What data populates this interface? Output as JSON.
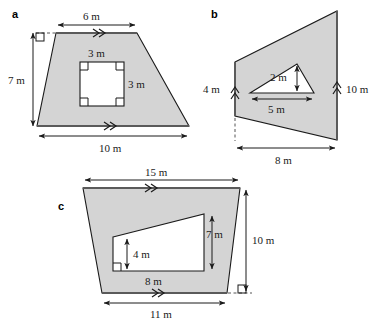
{
  "page": {
    "background_color": "#ffffff",
    "shape_fill_color": "#d4d4d4",
    "outline_color": "#1a1a1a",
    "hole_fill_color": "#ffffff"
  },
  "figures": [
    {
      "label": "a",
      "description": "Trapezium with a square hole cut out",
      "outer_shape": "trapezium",
      "inner_shape": "square",
      "right_angle_markers": 5,
      "parallel_marks": "double-chevron",
      "dimensions": [
        {
          "name": "top",
          "value": "6 m"
        },
        {
          "name": "height",
          "value": "7 m"
        },
        {
          "name": "bottom",
          "value": "10 m"
        },
        {
          "name": "hole-top",
          "value": "3 m"
        },
        {
          "name": "hole-side",
          "value": "3 m"
        }
      ]
    },
    {
      "label": "b",
      "description": "Trapezium on its side with a triangular hole cut out",
      "outer_shape": "trapezium",
      "inner_shape": "triangle",
      "parallel_marks": "double-chevron",
      "dimensions": [
        {
          "name": "left-side",
          "value": "4 m"
        },
        {
          "name": "right-side",
          "value": "10 m"
        },
        {
          "name": "base",
          "value": "8 m"
        },
        {
          "name": "triangle-height",
          "value": "2 m"
        },
        {
          "name": "triangle-base",
          "value": "5 m"
        }
      ]
    },
    {
      "label": "c",
      "description": "Trapezium with a trapezium hole cut out",
      "outer_shape": "trapezium",
      "inner_shape": "trapezium",
      "right_angle_markers": 2,
      "parallel_marks": "double-chevron",
      "dimensions": [
        {
          "name": "top",
          "value": "15 m"
        },
        {
          "name": "height",
          "value": "10 m"
        },
        {
          "name": "bottom",
          "value": "11 m"
        },
        {
          "name": "hole-left-height",
          "value": "4 m"
        },
        {
          "name": "hole-right-height",
          "value": "7 m"
        },
        {
          "name": "hole-base",
          "value": "8 m"
        }
      ]
    }
  ],
  "labels": {
    "fig_a": "a",
    "fig_b": "b",
    "fig_c": "c",
    "a_top": "6 m",
    "a_height": "7 m",
    "a_bottom": "10 m",
    "a_hole_top": "3 m",
    "a_hole_side": "3 m",
    "b_left": "4 m",
    "b_right": "10 m",
    "b_base": "8 m",
    "b_tri_height": "2 m",
    "b_tri_base": "5 m",
    "c_top": "15 m",
    "c_height": "10 m",
    "c_bottom": "11 m",
    "c_hole_left": "4 m",
    "c_hole_right": "7 m",
    "c_hole_base": "8 m"
  }
}
